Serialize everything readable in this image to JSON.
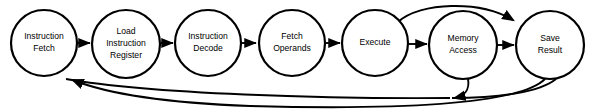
{
  "diagram": {
    "type": "flowchart",
    "stroke_color": "#000000",
    "fill_color": "#ffffff",
    "background": "#ffffff",
    "nodes": [
      {
        "id": "instruction-fetch",
        "lines": [
          "Instruction",
          "Fetch"
        ],
        "cx": 44,
        "cy": 43,
        "r": 33
      },
      {
        "id": "load-instruction-register",
        "lines": [
          "Load",
          "Instruction",
          "Register"
        ],
        "cx": 126,
        "cy": 44,
        "r": 34
      },
      {
        "id": "instruction-decode",
        "lines": [
          "Instruction",
          "Decode"
        ],
        "cx": 208,
        "cy": 43,
        "r": 33
      },
      {
        "id": "fetch-operands",
        "lines": [
          "Fetch",
          "Operands"
        ],
        "cx": 292,
        "cy": 43,
        "r": 33
      },
      {
        "id": "execute",
        "lines": [
          "Execute"
        ],
        "cx": 375,
        "cy": 43,
        "r": 33
      },
      {
        "id": "memory-access",
        "lines": [
          "Memory",
          "Access"
        ],
        "cx": 463,
        "cy": 45,
        "r": 34
      },
      {
        "id": "save-result",
        "lines": [
          "Save",
          "Result"
        ],
        "cx": 550,
        "cy": 45,
        "r": 34
      }
    ],
    "edges": [
      {
        "id": "edge-fetch-to-load",
        "from": "instruction-fetch",
        "to": "load-instruction-register",
        "kind": "straight"
      },
      {
        "id": "edge-load-to-decode",
        "from": "load-instruction-register",
        "to": "instruction-decode",
        "kind": "straight"
      },
      {
        "id": "edge-decode-to-operands",
        "from": "instruction-decode",
        "to": "fetch-operands",
        "kind": "straight"
      },
      {
        "id": "edge-operands-to-execute",
        "from": "fetch-operands",
        "to": "execute",
        "kind": "straight"
      },
      {
        "id": "edge-execute-to-memory",
        "from": "execute",
        "to": "memory-access",
        "kind": "straight"
      },
      {
        "id": "edge-memory-to-save",
        "from": "memory-access",
        "to": "save-result",
        "kind": "straight"
      },
      {
        "id": "edge-execute-to-save-bypass",
        "from": "execute",
        "to": "save-result",
        "kind": "arc-over"
      },
      {
        "id": "edge-memory-feedback",
        "from": "memory-access",
        "to": "instruction-fetch",
        "kind": "arc-under"
      },
      {
        "id": "edge-save-feedback",
        "from": "save-result",
        "to": "instruction-fetch",
        "kind": "arc-under-long"
      }
    ]
  }
}
